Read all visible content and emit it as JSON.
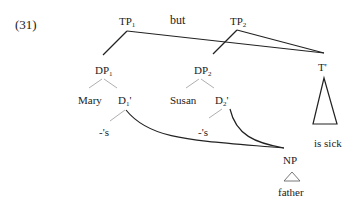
{
  "example_number": "(31)",
  "conjunction": "but",
  "nodes": {
    "tp1": {
      "label": "TP",
      "sub": "1"
    },
    "tp2": {
      "label": "TP",
      "sub": "2"
    },
    "dp1": {
      "label": "DP",
      "sub": "1"
    },
    "dp2": {
      "label": "DP",
      "sub": "2"
    },
    "tbar": {
      "label": "T'"
    },
    "mary": {
      "label": "Mary"
    },
    "d1bar": {
      "label": "D",
      "sub": "1",
      "prime": "'"
    },
    "susan": {
      "label": "Susan"
    },
    "d2bar": {
      "label": "D",
      "sub": "2",
      "prime": "'"
    },
    "poss1": {
      "label": "-'s"
    },
    "poss2": {
      "label": "-'s"
    },
    "tbar_content": {
      "label": "is sick"
    },
    "np": {
      "label": "NP"
    },
    "np_content": {
      "label": "father"
    }
  },
  "colors": {
    "line": "#222222",
    "thin_line": "#999999"
  }
}
